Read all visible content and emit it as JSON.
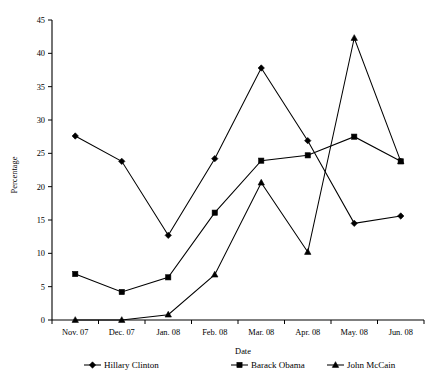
{
  "chart_data": {
    "type": "line",
    "title": "",
    "xlabel": "Date",
    "ylabel": "Percentage",
    "categories": [
      "Nov. 07",
      "Dec. 07",
      "Jan. 08",
      "Feb. 08",
      "Mar. 08",
      "Apr. 08",
      "May. 08",
      "Jun. 08"
    ],
    "ylim": [
      0,
      45
    ],
    "yticks": [
      0,
      5,
      10,
      15,
      20,
      25,
      30,
      35,
      40,
      45
    ],
    "ytick_labels": [
      "0",
      "5",
      "10",
      "15",
      "20",
      "25",
      "30",
      "35",
      "40",
      "45"
    ],
    "grid": false,
    "legend_position": "bottom",
    "series": [
      {
        "name": "Hillary Clinton",
        "marker": "diamond",
        "values": [
          27.6,
          23.8,
          12.7,
          24.2,
          37.8,
          26.9,
          14.5,
          15.6
        ]
      },
      {
        "name": "Barack Obama",
        "marker": "square",
        "values": [
          6.9,
          4.2,
          6.4,
          16.1,
          23.9,
          24.7,
          27.5,
          23.8
        ]
      },
      {
        "name": "John McCain",
        "marker": "triangle",
        "values": [
          0.0,
          0.0,
          0.8,
          6.8,
          20.6,
          10.2,
          42.3,
          23.8
        ]
      }
    ]
  },
  "axis": {
    "x_label": "Date",
    "y_label": "Percentage"
  },
  "legend": {
    "entries": [
      {
        "label": "Hillary Clinton",
        "marker_name": "diamond-marker-icon"
      },
      {
        "label": "Barack Obama",
        "marker_name": "square-marker-icon"
      },
      {
        "label": "John McCain",
        "marker_name": "triangle-marker-icon"
      }
    ]
  },
  "colors": {
    "ink": "#000000",
    "background": "#ffffff"
  }
}
